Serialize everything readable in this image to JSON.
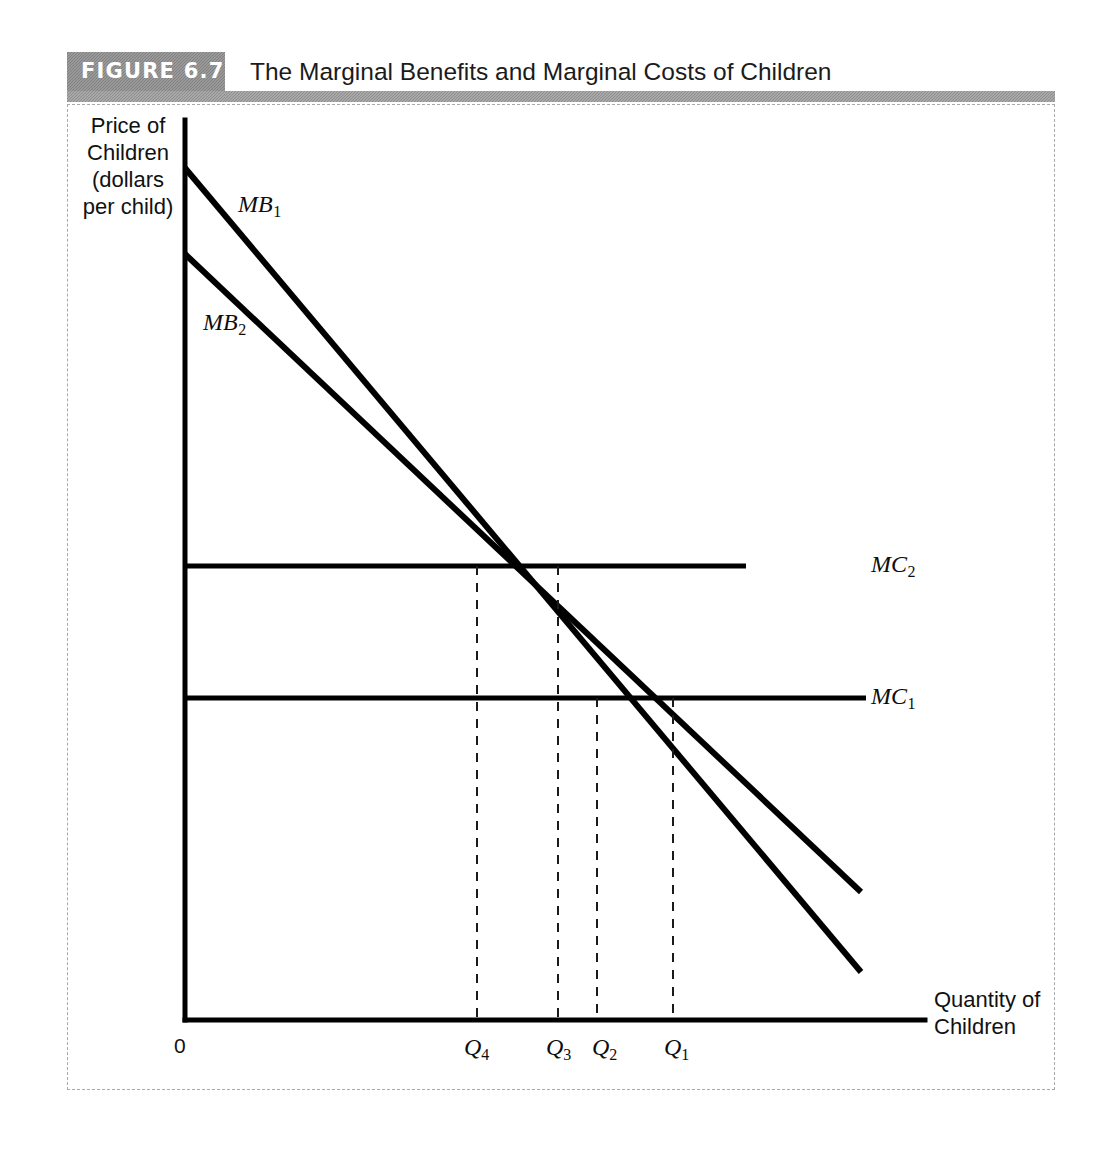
{
  "figure": {
    "badge": "FIGURE 6.7",
    "title": "The Marginal Benefits and Marginal Costs of Children"
  },
  "axes": {
    "y_title": "Price of\nChildren\n(dollars\nper child)",
    "x_title": "Quantity of\nChildren",
    "origin_label": "0"
  },
  "labels": {
    "mb1": "MB",
    "mb1_sub": "1",
    "mb2": "MB",
    "mb2_sub": "2",
    "mc1": "MC",
    "mc1_sub": "1",
    "mc2": "MC",
    "mc2_sub": "2",
    "q1": "Q",
    "q1_sub": "1",
    "q2": "Q",
    "q2_sub": "2",
    "q3": "Q",
    "q3_sub": "3",
    "q4": "Q",
    "q4_sub": "4"
  },
  "colors": {
    "curve": "#000000",
    "badge_bg": "#8a8a8a",
    "panel_border": "#a9a9a9",
    "dashed_guide": "#1a1a1a",
    "text": "#111111"
  },
  "chart_data": {
    "type": "line",
    "title": "The Marginal Benefits and Marginal Costs of Children",
    "xlabel": "Quantity of Children",
    "ylabel": "Price of Children (dollars per child)",
    "grid": false,
    "legend": "inline-curve-labels",
    "axis_pixels": {
      "origin_x": 185,
      "origin_y": 1020,
      "y_axis_top": 120,
      "x_axis_right": 925
    },
    "series": [
      {
        "name": "MB1",
        "kind": "downward-sloping-line",
        "points": [
          [
            185,
            168
          ],
          [
            861,
            972
          ]
        ],
        "label_pos": [
          238,
          192
        ]
      },
      {
        "name": "MB2",
        "kind": "downward-sloping-line",
        "points": [
          [
            185,
            254
          ],
          [
            861,
            892
          ]
        ],
        "label_pos": [
          203,
          310
        ]
      },
      {
        "name": "MC1",
        "kind": "horizontal-line",
        "points": [
          [
            185,
            698
          ],
          [
            866,
            698
          ]
        ],
        "label_pos": [
          871,
          684
        ]
      },
      {
        "name": "MC2",
        "kind": "horizontal-line",
        "points": [
          [
            185,
            566
          ],
          [
            746,
            566
          ]
        ],
        "label_pos": [
          871,
          552
        ]
      }
    ],
    "equilibria": [
      {
        "name": "Q4",
        "x_px": 477,
        "y_px": 566,
        "intersection": "MB2 x MC2"
      },
      {
        "name": "Q3",
        "x_px": 558,
        "y_px": 566,
        "intersection": "MB1 x MC2"
      },
      {
        "name": "Q2",
        "x_px": 597,
        "y_px": 698,
        "intersection": "MB2 x MC1"
      },
      {
        "name": "Q1",
        "x_px": 673,
        "y_px": 698,
        "intersection": "MB1 x MC1"
      }
    ],
    "x_ticks": [
      "Q4",
      "Q3",
      "Q2",
      "Q1"
    ],
    "x_tick_px": [
      477,
      558,
      597,
      673
    ],
    "y_ticks": []
  }
}
